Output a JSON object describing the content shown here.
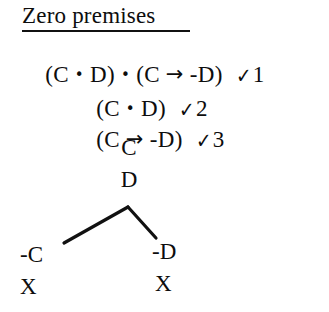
{
  "heading": {
    "label": "Zero premises",
    "underlined": true
  },
  "proof_lines": [
    {
      "id": "line-1",
      "left_paren": "(",
      "text": "(C • D) • (C → -D)",
      "segments": {
        "a": "(C ",
        "dot1": "•",
        "b": " D) ",
        "dot2": "•",
        "c": " (C ",
        "arrow": "→",
        "d": " -D)"
      },
      "check_mark": "✓",
      "check_number": "1"
    },
    {
      "id": "line-2",
      "text": "(C • D)",
      "segments": {
        "a": "(C ",
        "dot1": "•",
        "b": " D)"
      },
      "check_mark": "✓",
      "check_number": "2"
    },
    {
      "id": "line-3",
      "text": "(C → -D)",
      "segments": {
        "a": "(C ",
        "arrow": "→",
        "b": " -D)"
      },
      "check_mark": "✓",
      "check_number": "3"
    }
  ],
  "tree": {
    "trunk": [
      {
        "id": "node-c",
        "label": "C"
      },
      {
        "id": "node-d",
        "label": "D"
      }
    ],
    "branches": [
      {
        "id": "branch-left",
        "leaf": "-C",
        "closure": "X"
      },
      {
        "id": "branch-right",
        "leaf": "-D",
        "closure": "X"
      }
    ],
    "branch_apex": {
      "x": 128,
      "y": 207
    },
    "branch_left_end": {
      "x": 64,
      "y": 243
    },
    "branch_right_end": {
      "x": 156,
      "y": 238
    }
  },
  "colors": {
    "ink": "#0d0d0d",
    "background": "#ffffff",
    "rule": "#111111"
  }
}
